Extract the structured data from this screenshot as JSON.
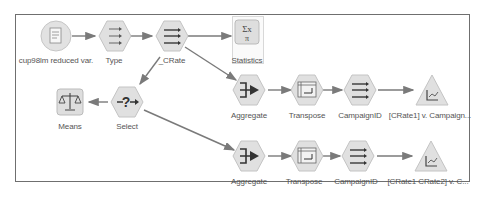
{
  "canvas": {
    "border_color": "#6f6f6f",
    "edge_color": "#7a7a7a"
  },
  "nodes": [
    {
      "id": "source",
      "label": "cup98lm reduced var.",
      "shape": "circle",
      "icon": "file-icon"
    },
    {
      "id": "type",
      "label": "Type",
      "shape": "hexagon",
      "icon": "type-icon"
    },
    {
      "id": "crate",
      "label": "_CRate",
      "shape": "hexagon",
      "icon": "derive-icon"
    },
    {
      "id": "statistics",
      "label": "Statistics",
      "shape": "square",
      "icon": "sigma-icon"
    },
    {
      "id": "select",
      "label": "Select",
      "shape": "hexagon",
      "icon": "select-icon"
    },
    {
      "id": "means",
      "label": "Means",
      "shape": "square",
      "icon": "scale-icon"
    },
    {
      "id": "aggregate1",
      "label": "Aggregate",
      "shape": "hexagon",
      "icon": "aggregate-icon"
    },
    {
      "id": "transpose1",
      "label": "Transpose",
      "shape": "hexagon",
      "icon": "transpose-icon"
    },
    {
      "id": "campaignid1",
      "label": "CampaignID",
      "shape": "hexagon",
      "icon": "derive-icon"
    },
    {
      "id": "plot1",
      "label": "[CRate1] v. Campaign...",
      "shape": "triangle",
      "icon": "plot-icon"
    },
    {
      "id": "aggregate2",
      "label": "Aggregate",
      "shape": "hexagon",
      "icon": "aggregate-icon"
    },
    {
      "id": "transpose2",
      "label": "Transpose",
      "shape": "hexagon",
      "icon": "transpose-icon"
    },
    {
      "id": "campaignid2",
      "label": "CampaignID",
      "shape": "hexagon",
      "icon": "derive-icon"
    },
    {
      "id": "plot2",
      "label": "[CRate1 CRate2] v. C...",
      "shape": "triangle",
      "icon": "plot-icon"
    }
  ],
  "edges": [
    [
      "source",
      "type"
    ],
    [
      "type",
      "crate"
    ],
    [
      "crate",
      "statistics"
    ],
    [
      "crate",
      "select"
    ],
    [
      "crate",
      "aggregate1"
    ],
    [
      "select",
      "means"
    ],
    [
      "select",
      "aggregate2"
    ],
    [
      "aggregate1",
      "transpose1"
    ],
    [
      "transpose1",
      "campaignid1"
    ],
    [
      "campaignid1",
      "plot1"
    ],
    [
      "aggregate2",
      "transpose2"
    ],
    [
      "transpose2",
      "campaignid2"
    ],
    [
      "campaignid2",
      "plot2"
    ]
  ]
}
